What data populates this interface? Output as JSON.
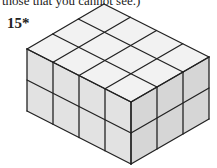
{
  "caption": "those that you cannot see.)",
  "problem": {
    "label": "15*"
  },
  "figure": {
    "dimensions": {
      "length": 4,
      "width": 3,
      "height": 2
    },
    "colors": {
      "top": "#f2f2f2",
      "left": "#e2e2e2",
      "right": "#d6d6d6",
      "edge": "#222222"
    }
  }
}
